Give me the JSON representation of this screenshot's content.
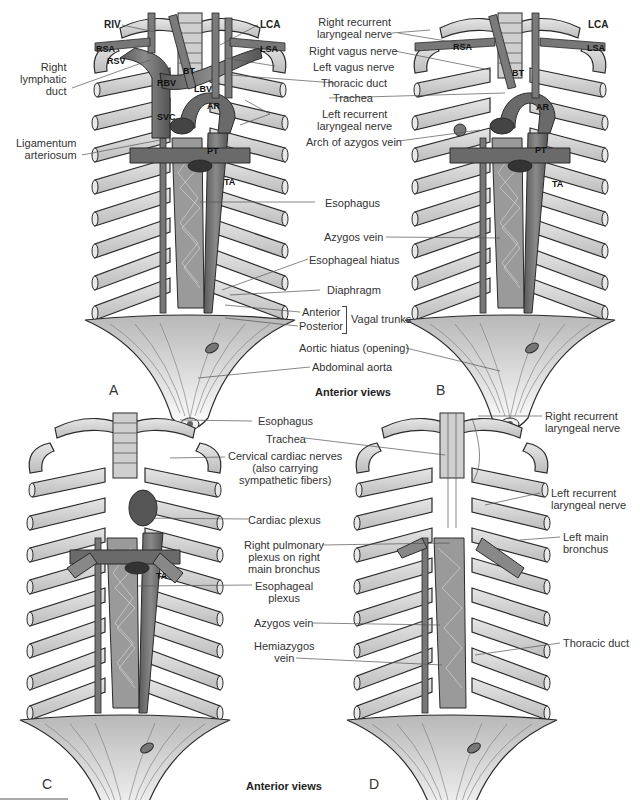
{
  "figure": {
    "captions": [
      "Anterior views",
      "Anterior views"
    ],
    "panels": [
      "A",
      "B",
      "C",
      "D"
    ]
  },
  "panel_a": {
    "abbreviations": {
      "riv": "RIV",
      "lca": "LCA",
      "rsa": "RSA",
      "lsa": "LSA",
      "rsv": "RSV",
      "rbv": "RBV",
      "bt": "BT",
      "lbv": "LBV",
      "ar": "AR",
      "svc": "SVC",
      "pt": "PT",
      "ta": "TA"
    },
    "left_labels": {
      "right_lymphatic_duct": [
        "Right",
        "lymphatic",
        "duct"
      ],
      "ligamentum_arteriosum": [
        "Ligamentum",
        "arteriosum"
      ]
    }
  },
  "center_top_labels": {
    "right_recurrent_laryngeal_nerve": [
      "Right recurrent",
      "laryngeal nerve"
    ],
    "right_vagus_nerve": "Right vagus nerve",
    "left_vagus_nerve": "Left vagus nerve",
    "thoracic_duct": "Thoracic duct",
    "trachea": "Trachea",
    "left_recurrent_laryngeal_nerve": [
      "Left recurrent",
      "laryngeal nerve"
    ],
    "arch_of_azygos_vein": "Arch of azygos vein",
    "esophagus": "Esophagus",
    "azygos_vein": "Azygos vein",
    "esophageal_hiatus": "Esophageal hiatus",
    "diaphragm": "Diaphragm",
    "anterior": "Anterior",
    "posterior": "Posterior",
    "vagal_trunks": "Vagal trunks",
    "aortic_hiatus": "Aortic hiatus (opening)",
    "abdominal_aorta": "Abdominal aorta"
  },
  "panel_b": {
    "abbreviations": {
      "lca": "LCA",
      "rsa": "RSA",
      "lsa": "LSA",
      "bt": "BT",
      "ar": "AR",
      "pt": "PT",
      "ta": "TA"
    }
  },
  "center_bottom_labels": {
    "esophagus": "Esophagus",
    "trachea": "Trachea",
    "cervical_cardiac_nerves": [
      "Cervical cardiac nerves",
      "(also carrying",
      "sympathetic fibers)"
    ],
    "cardiac_plexus": "Cardiac plexus",
    "right_pulmonary_plexus": [
      "Right pulmonary",
      "plexus on right",
      "main bronchus"
    ],
    "esophageal_plexus": [
      "Esophageal",
      "plexus"
    ],
    "azygos_vein": "Azygos vein",
    "hemiazygos_vein": [
      "Hemiazygos",
      "vein"
    ]
  },
  "panel_c": {
    "abbreviations": {
      "ta": "TA"
    }
  },
  "panel_d": {
    "right_labels": {
      "right_recurrent_laryngeal_nerve": [
        "Right recurrent",
        "laryngeal nerve"
      ],
      "left_recurrent_laryngeal_nerve": [
        "Left recurrent",
        "laryngeal nerve"
      ],
      "left_main_bronchus": [
        "Left main",
        "bronchus"
      ],
      "thoracic_duct": "Thoracic duct"
    }
  },
  "colors": {
    "bone_fill": "#d8d8d8",
    "bone_stroke": "#2a2a2a",
    "vessel_fill": "#6e6e6e",
    "vessel_dark": "#4a4a4a",
    "diaphragm_fill": "#c9c9c9",
    "leader_line": "#555555"
  }
}
